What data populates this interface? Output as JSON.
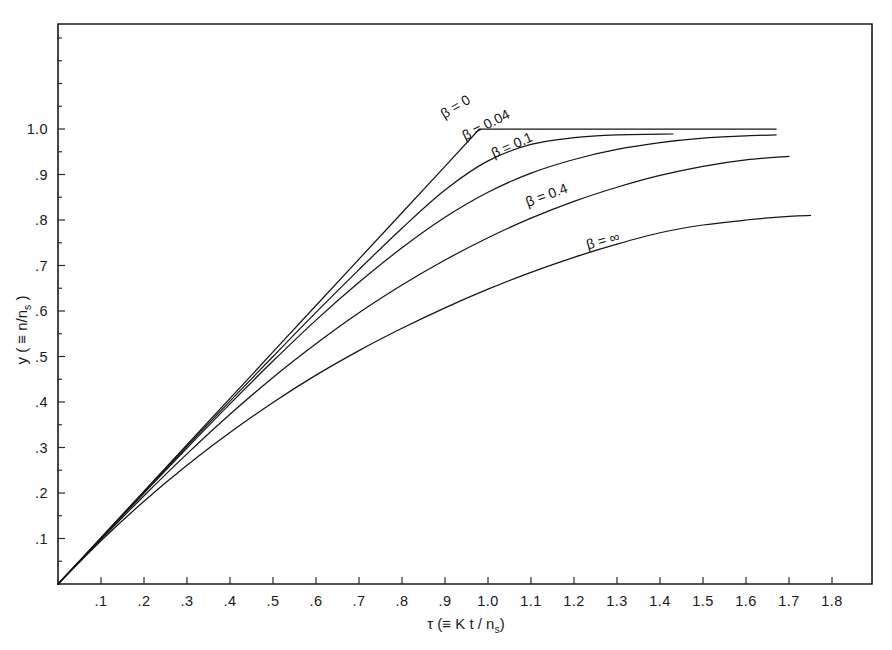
{
  "figure": {
    "background_color": "#ffffff",
    "line_color": "#151515"
  },
  "axes": {
    "x_title": "τ  (≡ K t / n",
    "x_title_sub": "s",
    "x_title_end": ")",
    "y_title": "y ( ≡ n/n",
    "y_title_sub": "s",
    "y_title_end": " )",
    "x_ticks": [
      ".1",
      ".2",
      ".3",
      ".4",
      ".5",
      ".6",
      ".7",
      ".8",
      ".9",
      "1.0",
      "1.1",
      "1.2",
      "1.3",
      "1.4",
      "1.5",
      "1.6",
      "1.7",
      "1.8"
    ],
    "y_ticks": [
      "1.0",
      ".9",
      ".8",
      ".7",
      ".6",
      ".5",
      ".4",
      ".3",
      ".2",
      ".1"
    ]
  },
  "curve_labels": {
    "b0": "β = 0",
    "b004": "β = 0.04",
    "b01": "β = 0.1",
    "b04": "β = 0.4",
    "binf": "β = ∞"
  },
  "chart_data": {
    "type": "line",
    "title": "",
    "xlabel": "τ (≡ K t / n_s)",
    "ylabel": "y (≡ n/n_s)",
    "xlim": [
      0,
      1.89
    ],
    "ylim": [
      0,
      1.23
    ],
    "grid": false,
    "legend": "inline-curve-labels",
    "x_tick_values": [
      0.1,
      0.2,
      0.3,
      0.4,
      0.5,
      0.6,
      0.7,
      0.8,
      0.9,
      1.0,
      1.1,
      1.2,
      1.3,
      1.4,
      1.5,
      1.6,
      1.7,
      1.8
    ],
    "y_tick_values": [
      1.0,
      0.9,
      0.8,
      0.7,
      0.6,
      0.5,
      0.4,
      0.3,
      0.2,
      0.1
    ],
    "series": [
      {
        "name": "β = 0",
        "label_position": {
          "x": 0.93,
          "y": 1.04
        },
        "x": [
          0,
          0.1,
          0.2,
          0.3,
          0.4,
          0.5,
          0.6,
          0.7,
          0.8,
          0.9,
          0.98,
          1.1,
          1.3,
          1.5,
          1.67
        ],
        "y": [
          0,
          0.102,
          0.204,
          0.306,
          0.408,
          0.51,
          0.612,
          0.714,
          0.816,
          0.918,
          1.0,
          1.0,
          1.0,
          1.0,
          1.0
        ]
      },
      {
        "name": "β = 0.04",
        "label_position": {
          "x": 1.0,
          "y": 1.0
        },
        "x": [
          0,
          0.1,
          0.2,
          0.3,
          0.4,
          0.5,
          0.6,
          0.7,
          0.8,
          0.9,
          1.0,
          1.1,
          1.2,
          1.3,
          1.43
        ],
        "y": [
          0,
          0.101,
          0.202,
          0.303,
          0.402,
          0.5,
          0.597,
          0.691,
          0.782,
          0.866,
          0.93,
          0.966,
          0.981,
          0.987,
          0.989
        ]
      },
      {
        "name": "β = 0.1",
        "label_position": {
          "x": 1.06,
          "y": 0.955
        },
        "x": [
          0,
          0.1,
          0.2,
          0.3,
          0.4,
          0.5,
          0.6,
          0.7,
          0.8,
          0.9,
          1.0,
          1.1,
          1.2,
          1.3,
          1.4,
          1.5,
          1.6,
          1.67
        ],
        "y": [
          0,
          0.1,
          0.2,
          0.299,
          0.396,
          0.49,
          0.58,
          0.663,
          0.739,
          0.806,
          0.861,
          0.903,
          0.933,
          0.955,
          0.97,
          0.98,
          0.985,
          0.987
        ]
      },
      {
        "name": "β = 0.4",
        "label_position": {
          "x": 1.14,
          "y": 0.845
        },
        "x": [
          0,
          0.1,
          0.2,
          0.3,
          0.4,
          0.5,
          0.6,
          0.7,
          0.8,
          0.9,
          1.0,
          1.1,
          1.2,
          1.3,
          1.4,
          1.5,
          1.6,
          1.7
        ],
        "y": [
          0,
          0.098,
          0.194,
          0.286,
          0.373,
          0.454,
          0.528,
          0.596,
          0.657,
          0.712,
          0.761,
          0.804,
          0.841,
          0.872,
          0.898,
          0.918,
          0.932,
          0.94
        ]
      },
      {
        "name": "β = ∞",
        "label_position": {
          "x": 1.27,
          "y": 0.745
        },
        "x": [
          0,
          0.1,
          0.2,
          0.3,
          0.4,
          0.5,
          0.6,
          0.7,
          0.8,
          0.9,
          1.0,
          1.1,
          1.2,
          1.3,
          1.4,
          1.5,
          1.6,
          1.7,
          1.75
        ],
        "y": [
          0,
          0.095,
          0.182,
          0.261,
          0.333,
          0.399,
          0.459,
          0.513,
          0.562,
          0.607,
          0.648,
          0.685,
          0.718,
          0.747,
          0.772,
          0.789,
          0.8,
          0.808,
          0.81
        ]
      }
    ]
  }
}
